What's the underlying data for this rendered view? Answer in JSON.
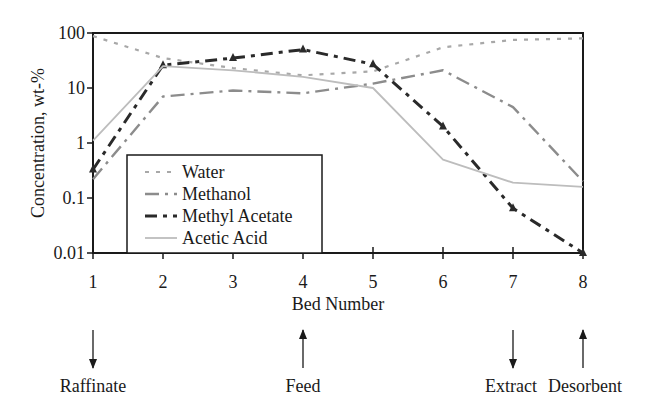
{
  "chart_data": {
    "type": "line",
    "title": "",
    "xlabel": "Bed Number",
    "ylabel": "Concentration, wt-%",
    "yscale": "log",
    "ylim": [
      0.01,
      100
    ],
    "xlim": [
      1,
      8
    ],
    "x": [
      1,
      2,
      3,
      4,
      5,
      6,
      7,
      8
    ],
    "x_tick_labels": [
      "1",
      "2",
      "3",
      "4",
      "5",
      "6",
      "7",
      "8"
    ],
    "y_ticks": [
      100,
      10,
      1,
      0.1,
      0.01
    ],
    "y_tick_labels": [
      "100",
      "10",
      "1",
      "0.1",
      "0.01"
    ],
    "grid": false,
    "legend_position": "lower-left (inside plot)",
    "series": [
      {
        "name": "Water",
        "color": "#a8a8a8",
        "style": "short-dash",
        "values": [
          88,
          35,
          23,
          17,
          20,
          55,
          75,
          80
        ]
      },
      {
        "name": "Methanol",
        "color": "#8c8c8c",
        "style": "long-dash-dot",
        "values": [
          0.22,
          7,
          9,
          8,
          12,
          21,
          4.5,
          0.2
        ]
      },
      {
        "name": "Methyl Acetate",
        "color": "#2a2a2a",
        "style": "dash-dot-triangle",
        "values": [
          0.33,
          26,
          35,
          50,
          27,
          2,
          0.065,
          0.01
        ]
      },
      {
        "name": "Acetic Acid",
        "color": "#bdbdbd",
        "style": "solid",
        "values": [
          1.1,
          25,
          21,
          16,
          10,
          0.5,
          0.19,
          0.16
        ]
      }
    ],
    "annotations": [
      {
        "label": "Raffinate",
        "bed": 1,
        "arrow": "down"
      },
      {
        "label": "Feed",
        "bed": 4,
        "arrow": "up"
      },
      {
        "label": "Extract",
        "bed": 7,
        "arrow": "down"
      },
      {
        "label": "Desorbent",
        "bed": 8,
        "arrow": "up"
      }
    ]
  },
  "labels": {
    "xlabel": "Bed Number",
    "ylabel": "Concentration, wt-%",
    "legend": [
      "Water",
      "Methanol",
      "Methyl Acetate",
      "Acetic Acid"
    ],
    "streams": [
      "Raffinate",
      "Feed",
      "Extract",
      "Desorbent"
    ]
  }
}
